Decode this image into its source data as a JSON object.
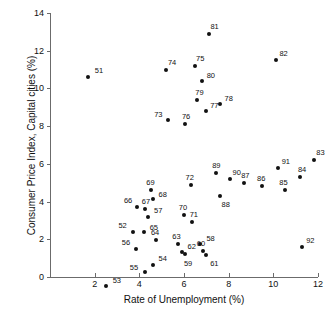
{
  "chart_data": {
    "type": "scatter",
    "title": "",
    "xlabel": "Rate of Unemployment (%)",
    "ylabel": "Consumer Price Index, Capital cities (%)",
    "xlim": [
      0,
      12
    ],
    "ylim": [
      -2,
      14
    ],
    "grid": false,
    "legend": "none",
    "xticks": [
      2,
      4,
      6,
      8,
      10,
      12
    ],
    "yticks": [
      0,
      2,
      4,
      6,
      8,
      10,
      12,
      14
    ],
    "point_label_field": "year (last two digits)",
    "points": [
      {
        "label": "51",
        "x": 1.7,
        "y": 10.6
      },
      {
        "label": "52",
        "x": 3.7,
        "y": 2.4
      },
      {
        "label": "53",
        "x": 2.5,
        "y": -0.5
      },
      {
        "label": "54",
        "x": 4.6,
        "y": 0.65
      },
      {
        "label": "55",
        "x": 4.25,
        "y": 0.25
      },
      {
        "label": "56",
        "x": 3.85,
        "y": 1.5
      },
      {
        "label": "57",
        "x": 4.4,
        "y": 3.2
      },
      {
        "label": "58",
        "x": 6.7,
        "y": 1.75
      },
      {
        "label": "59",
        "x": 6.05,
        "y": 1.2
      },
      {
        "label": "60",
        "x": 6.85,
        "y": 1.4
      },
      {
        "label": "61",
        "x": 7.0,
        "y": 1.15
      },
      {
        "label": "62",
        "x": 5.9,
        "y": 1.35
      },
      {
        "label": "63",
        "x": 5.75,
        "y": 1.75
      },
      {
        "label": "64",
        "x": 4.75,
        "y": 1.95
      },
      {
        "label": "65",
        "x": 4.2,
        "y": 2.4
      },
      {
        "label": "66",
        "x": 3.9,
        "y": 3.7
      },
      {
        "label": "67",
        "x": 4.25,
        "y": 3.6
      },
      {
        "label": "68",
        "x": 4.6,
        "y": 4.15
      },
      {
        "label": "69",
        "x": 4.5,
        "y": 4.6
      },
      {
        "label": "70",
        "x": 6.0,
        "y": 3.3
      },
      {
        "label": "71",
        "x": 6.35,
        "y": 2.9
      },
      {
        "label": "72",
        "x": 6.3,
        "y": 4.9
      },
      {
        "label": "73",
        "x": 5.3,
        "y": 8.3
      },
      {
        "label": "74",
        "x": 5.2,
        "y": 11.0
      },
      {
        "label": "75",
        "x": 6.5,
        "y": 11.2
      },
      {
        "label": "76",
        "x": 6.05,
        "y": 8.1
      },
      {
        "label": "77",
        "x": 7.0,
        "y": 8.8
      },
      {
        "label": "78",
        "x": 7.6,
        "y": 9.2
      },
      {
        "label": "79",
        "x": 6.6,
        "y": 9.4
      },
      {
        "label": "80",
        "x": 6.8,
        "y": 10.4
      },
      {
        "label": "81",
        "x": 7.1,
        "y": 12.9
      },
      {
        "label": "82",
        "x": 10.1,
        "y": 11.5
      },
      {
        "label": "83",
        "x": 11.8,
        "y": 6.2
      },
      {
        "label": "84",
        "x": 11.2,
        "y": 5.3
      },
      {
        "label": "85",
        "x": 10.5,
        "y": 4.6
      },
      {
        "label": "86",
        "x": 9.5,
        "y": 4.8
      },
      {
        "label": "87",
        "x": 8.7,
        "y": 5.0
      },
      {
        "label": "88",
        "x": 7.6,
        "y": 4.3
      },
      {
        "label": "89",
        "x": 7.45,
        "y": 5.5
      },
      {
        "label": "90",
        "x": 8.05,
        "y": 5.2
      },
      {
        "label": "91",
        "x": 10.2,
        "y": 5.8
      },
      {
        "label": "92",
        "x": 11.3,
        "y": 1.6
      }
    ]
  }
}
